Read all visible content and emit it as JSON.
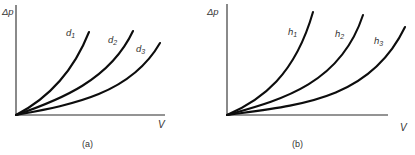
{
  "figure": {
    "panels": [
      {
        "id": "a",
        "caption": "(a)",
        "y_axis_label": "Δp",
        "x_axis_label": "V",
        "curves": [
          {
            "label_base": "d",
            "label_sub": "1",
            "path": "M16 115 C 45 100, 72 75, 89 32",
            "lx": 66,
            "ly": 36
          },
          {
            "label_base": "d",
            "label_sub": "2",
            "path": "M16 115 C 60 100, 110 80, 133 31",
            "lx": 108,
            "ly": 43
          },
          {
            "label_base": "d",
            "label_sub": "3",
            "path": "M16 115 C 70 105, 130 95, 160 43",
            "lx": 136,
            "ly": 52
          }
        ]
      },
      {
        "id": "b",
        "caption": "(b)",
        "y_axis_label": "Δp",
        "x_axis_label": "V",
        "curves": [
          {
            "label_base": "h",
            "label_sub": "1",
            "path": "M227 115 C 262 100, 295 75, 313 12",
            "lx": 288,
            "ly": 35
          },
          {
            "label_base": "h",
            "label_sub": "2",
            "path": "M227 115 C 280 100, 340 85, 363 15",
            "lx": 335,
            "ly": 37
          },
          {
            "label_base": "h",
            "label_sub": "3",
            "path": "M227 115 C 300 105, 370 100, 405 27",
            "lx": 374,
            "ly": 44
          }
        ]
      }
    ]
  }
}
